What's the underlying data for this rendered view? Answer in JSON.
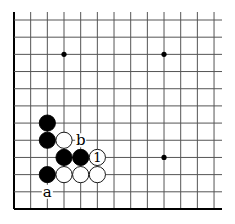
{
  "diagram": {
    "type": "go-board-fragment",
    "grid": {
      "columns": 13,
      "rows": 12,
      "x0": 14,
      "dx": 16.67,
      "y0": 20,
      "dy": 17.18,
      "line_extend_right": 222,
      "line_extend_top": 12,
      "edges": [
        "left",
        "bottom"
      ],
      "line_color": "#555555",
      "edge_color": "#000000"
    },
    "star_points": [
      {
        "col": 3,
        "row": 2
      },
      {
        "col": 9,
        "row": 2
      },
      {
        "col": 9,
        "row": 8
      }
    ],
    "stones": [
      {
        "color": "black",
        "col": 2,
        "row": 6
      },
      {
        "color": "black",
        "col": 2,
        "row": 7
      },
      {
        "color": "white",
        "col": 3,
        "row": 7
      },
      {
        "color": "black",
        "col": 3,
        "row": 8
      },
      {
        "color": "black",
        "col": 4,
        "row": 8
      },
      {
        "color": "white",
        "col": 5,
        "row": 8,
        "label": "1"
      },
      {
        "color": "black",
        "col": 2,
        "row": 9
      },
      {
        "color": "white",
        "col": 3,
        "row": 9
      },
      {
        "color": "white",
        "col": 4,
        "row": 9
      },
      {
        "color": "white",
        "col": 5,
        "row": 9
      }
    ],
    "labels": [
      {
        "text": "b",
        "col": 4,
        "row": 7
      },
      {
        "text": "a",
        "col": 2,
        "row": 10
      }
    ]
  }
}
